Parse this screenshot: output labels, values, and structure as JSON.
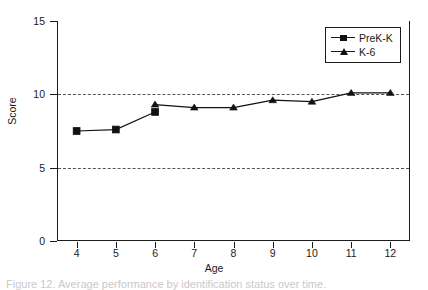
{
  "figure": {
    "caption": "Figure 12. Average performance by identification status over time."
  },
  "chart_data": {
    "type": "line",
    "title": "",
    "xlabel": "Age",
    "ylabel": "Score",
    "xlim": [
      3.5,
      12.5
    ],
    "ylim": [
      0,
      15
    ],
    "x": [
      4,
      5,
      6,
      7,
      8,
      9,
      10,
      11,
      12
    ],
    "xticklabels": [
      "4",
      "5",
      "6",
      "7",
      "8",
      "9",
      "10",
      "11",
      "12"
    ],
    "yticks": [
      0,
      5,
      10,
      15
    ],
    "yticklabels": [
      "0",
      "5",
      "10",
      "15"
    ],
    "grid": "horizontal-dashed-at-5-and-10",
    "legend_position": "upper right (inside axes)",
    "series": [
      {
        "name": "PreK-K",
        "marker": "filled-square",
        "color": "#111111",
        "x": [
          4,
          5,
          6
        ],
        "values": [
          7.5,
          7.6,
          8.8
        ]
      },
      {
        "name": "K-6",
        "marker": "filled-triangle",
        "color": "#111111",
        "x": [
          6,
          7,
          8,
          9,
          10,
          11,
          12
        ],
        "values": [
          9.3,
          9.1,
          9.1,
          9.6,
          9.5,
          10.1,
          10.1
        ]
      }
    ]
  }
}
